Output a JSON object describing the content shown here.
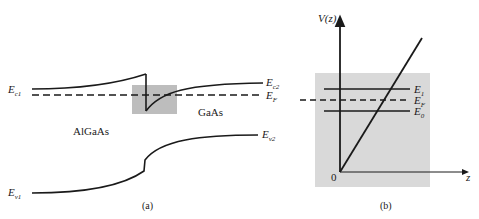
{
  "figure": {
    "panel_a": {
      "caption": "(a)",
      "labels": {
        "ec1": {
          "main": "E",
          "sub": "c1"
        },
        "ec2": {
          "main": "E",
          "sub": "c2"
        },
        "ef": {
          "main": "E",
          "sub": "F"
        },
        "ev1": {
          "main": "E",
          "sub": "v1"
        },
        "ev2": {
          "main": "E",
          "sub": "v2"
        },
        "material_left": "AlGaAs",
        "material_right": "GaAs"
      }
    },
    "panel_b": {
      "caption": "(b)",
      "labels": {
        "y_axis": "V(z)",
        "x_axis": "z",
        "origin": "0",
        "e1": {
          "main": "E",
          "sub": "1"
        },
        "ef": {
          "main": "E",
          "sub": "F"
        },
        "e0": {
          "main": "E",
          "sub": "0"
        }
      }
    },
    "colors": {
      "line": "#1a1a1a",
      "shade": "#c8c8c8",
      "shade_light": "#dcdcdc"
    }
  }
}
